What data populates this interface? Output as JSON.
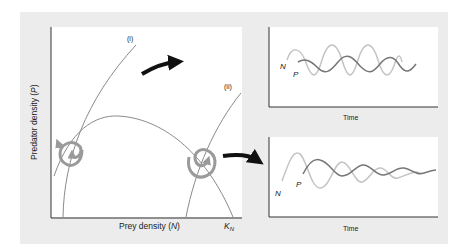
{
  "colors": {
    "panel_bg": "#ececec",
    "plot_bg": "#ffffff",
    "axis": "#333333",
    "isocline": "#8a8a8a",
    "spiral": "#9a9a9a",
    "arrow": "#111111",
    "prey_series": "#c4c4c4",
    "predator_series": "#767676"
  },
  "phase_plane": {
    "y_axis_label": "Predator density (",
    "y_axis_var": "P",
    "y_axis_close": ")",
    "x_axis_label": "Prey density (",
    "x_axis_var": "N",
    "x_axis_close": ")",
    "carrying_capacity_label": "K",
    "carrying_capacity_sub": "N",
    "isocline_i_label": "(i)",
    "isocline_ii_label": "(ii)"
  },
  "time_series_top": {
    "x_axis_label": "Time",
    "prey_label": "N",
    "predator_label": "P",
    "behavior": "stable limit cycle / persistent oscillations"
  },
  "time_series_bottom": {
    "x_axis_label": "Time",
    "prey_label": "N",
    "predator_label": "P",
    "behavior": "damped oscillations"
  }
}
